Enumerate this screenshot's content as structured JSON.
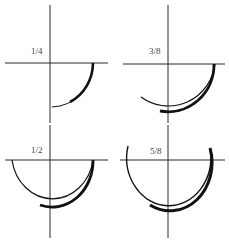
{
  "figure": {
    "panels": [
      {
        "id": "quarter",
        "label": "1/4",
        "fraction": 0.25
      },
      {
        "id": "three-eighths",
        "label": "3/8",
        "fraction": 0.375
      },
      {
        "id": "half",
        "label": "1/2",
        "fraction": 0.5
      },
      {
        "id": "five-eighths",
        "label": "5/8",
        "fraction": 0.625
      }
    ],
    "caption": "",
    "colors": {
      "line": "#2a2a2a",
      "arc": "#111111",
      "label": "#444444",
      "background": "#ffffff"
    }
  }
}
